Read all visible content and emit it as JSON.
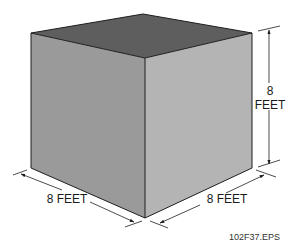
{
  "diagram": {
    "faces": {
      "top_color": "#5e5e5e",
      "left_color": "#9a9a9a",
      "right_color": "#b4b4b4"
    },
    "dimensions": {
      "height": {
        "value": "8",
        "unit": "FEET"
      },
      "left_width": {
        "label": "8 FEET"
      },
      "right_depth": {
        "label": "8 FEET"
      }
    },
    "figure_id": "102F37.EPS"
  }
}
